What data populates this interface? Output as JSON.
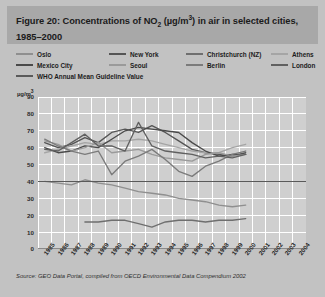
{
  "header": {
    "title_prefix": "Figure 20: Concentrations of NO",
    "title_sub": "2",
    "title_mid": " (µg/m",
    "title_sup": "3",
    "title_suffix": ") in air in selected cities, 1985–2000",
    "title_plain": "Figure 20: Concentrations of NO2 (µg/m3) in air in selected cities, 1985–2000"
  },
  "legend": {
    "items": [
      {
        "label": "Oslo",
        "color": "#8f8f8f",
        "col": 0,
        "row": 0
      },
      {
        "label": "New York",
        "color": "#555555",
        "col": 1,
        "row": 0
      },
      {
        "label": "Christchurch (NZ)",
        "color": "#6f6f6f",
        "col": 2,
        "row": 0
      },
      {
        "label": "Athens",
        "color": "#a5a5a5",
        "col": 3,
        "row": 0
      },
      {
        "label": "Mexico City",
        "color": "#4a4a4a",
        "col": 0,
        "row": 1
      },
      {
        "label": "Seoul",
        "color": "#9a9a9a",
        "col": 1,
        "row": 1
      },
      {
        "label": "Berlin",
        "color": "#7b7b7b",
        "col": 2,
        "row": 1
      },
      {
        "label": "London",
        "color": "#606060",
        "col": 3,
        "row": 1
      },
      {
        "label": "WHO Annual Mean Guideline Value",
        "color": "#5a5a5a",
        "col": 0,
        "row": 2
      }
    ]
  },
  "source": {
    "text": "Source: GEO Data Portal, compiled from OECD Environmental Data Compendium 2002"
  },
  "colors": {
    "page_background": "#c2c2c2",
    "header_background": "#a8a8a8",
    "plot_background": "#cfcfcf",
    "gridline": "#ffffff",
    "axis": "#8a8a8a",
    "text": "#1b1b1b"
  },
  "chart_data": {
    "type": "line",
    "title": "Figure 20: Concentrations of NO2 (µg/m3) in air in selected cities, 1985–2000",
    "xlabel": "",
    "ylabel": "µg/m³",
    "ylim": [
      0,
      90
    ],
    "yticks": [
      0,
      10,
      20,
      30,
      40,
      50,
      60,
      70,
      80,
      90
    ],
    "xlim": [
      1985,
      2004
    ],
    "xticks": [
      1985,
      1986,
      1987,
      1988,
      1989,
      1990,
      1991,
      1992,
      1993,
      1994,
      1995,
      1996,
      1997,
      1998,
      1999,
      2000,
      2001,
      2002,
      2003,
      2004
    ],
    "grid": true,
    "legend_position": "top",
    "x": [
      1985,
      1986,
      1987,
      1988,
      1989,
      1990,
      1991,
      1992,
      1993,
      1994,
      1995,
      1996,
      1997,
      1998,
      1999,
      2000
    ],
    "series": [
      {
        "name": "Oslo",
        "color": "#8f8f8f",
        "values": [
          40,
          39,
          38,
          41,
          39,
          38,
          36,
          34,
          33,
          32,
          30,
          29,
          28,
          26,
          25,
          26
        ]
      },
      {
        "name": "New York",
        "color": "#555555",
        "values": [
          63,
          60,
          62,
          66,
          63,
          69,
          71,
          69,
          73,
          69,
          64,
          59,
          57,
          56,
          55,
          57
        ]
      },
      {
        "name": "Christchurch (NZ)",
        "color": "#6f6f6f",
        "values": [
          null,
          null,
          null,
          16,
          16,
          17,
          17,
          15,
          13,
          16,
          17,
          17,
          16,
          17,
          17,
          18
        ]
      },
      {
        "name": "Athens",
        "color": "#a5a5a5",
        "values": [
          57,
          59,
          61,
          63,
          62,
          64,
          64,
          65,
          64,
          62,
          60,
          58,
          57,
          57,
          60,
          62
        ]
      },
      {
        "name": "Mexico City",
        "color": "#4a4a4a",
        "values": [
          60,
          57,
          58,
          61,
          60,
          65,
          70,
          72,
          71,
          70,
          69,
          63,
          58,
          55,
          56,
          56
        ]
      },
      {
        "name": "Seoul",
        "color": "#9a9a9a",
        "values": [
          64,
          62,
          58,
          60,
          63,
          57,
          58,
          59,
          56,
          54,
          53,
          52,
          56,
          57,
          55,
          56
        ]
      },
      {
        "name": "Berlin",
        "color": "#7b7b7b",
        "values": [
          65,
          61,
          58,
          56,
          58,
          44,
          52,
          55,
          59,
          53,
          46,
          43,
          49,
          52,
          56,
          58
        ]
      },
      {
        "name": "London",
        "color": "#606060",
        "values": [
          59,
          58,
          63,
          68,
          61,
          61,
          58,
          75,
          61,
          58,
          57,
          56,
          54,
          55,
          54,
          56
        ]
      },
      {
        "name": "WHO Annual Mean Guideline Value",
        "color": "#5a5a5a",
        "constant": 40,
        "spans_full_axis": true,
        "values": [
          40,
          40,
          40,
          40,
          40,
          40,
          40,
          40,
          40,
          40,
          40,
          40,
          40,
          40,
          40,
          40
        ]
      }
    ]
  }
}
